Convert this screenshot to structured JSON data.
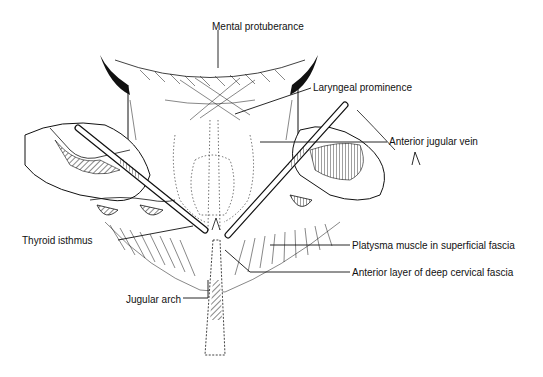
{
  "figure": {
    "labels": [
      {
        "id": "mental-protuberance",
        "text": "Mental protuberance",
        "x": 212,
        "y": 21
      },
      {
        "id": "laryngeal-prominence",
        "text": "Laryngeal prominence",
        "x": 313,
        "y": 82
      },
      {
        "id": "anterior-jugular-vein",
        "text": "Anterior jugular vein",
        "x": 389,
        "y": 136
      },
      {
        "id": "thyroid-isthmus",
        "text": "Thyroid isthmus",
        "x": 22,
        "y": 235
      },
      {
        "id": "platysma-muscle",
        "text": "Platysma muscle in superficial fascia",
        "x": 352,
        "y": 240
      },
      {
        "id": "anterior-layer-deep-cervical-fascia",
        "text": "Anterior layer of deep cervical fascia",
        "x": 352,
        "y": 267
      },
      {
        "id": "jugular-arch",
        "text": "Jugular arch",
        "x": 126,
        "y": 294
      }
    ],
    "colors": {
      "ink": "#111111",
      "background": "#ffffff"
    }
  }
}
